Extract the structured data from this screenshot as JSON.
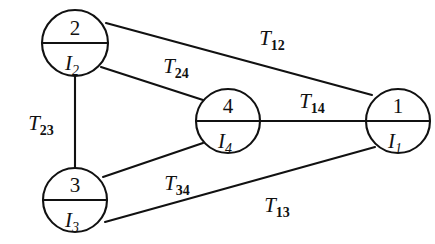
{
  "diagram": {
    "type": "thermal-network-graph",
    "canvas": {
      "width": 435,
      "height": 244,
      "background": "#ffffff"
    },
    "stroke_color": "#111111",
    "nodes": [
      {
        "id": "node-1",
        "top_label": "1",
        "bottom_label": "I",
        "bottom_sub": "1",
        "cx": 398,
        "cy": 121,
        "r": 32
      },
      {
        "id": "node-2",
        "top_label": "2",
        "bottom_label": "I",
        "bottom_sub": "2",
        "cx": 75,
        "cy": 43,
        "r": 33
      },
      {
        "id": "node-3",
        "top_label": "3",
        "bottom_label": "I",
        "bottom_sub": "3",
        "cx": 75,
        "cy": 200,
        "r": 32
      },
      {
        "id": "node-4",
        "top_label": "4",
        "bottom_label": "I",
        "bottom_sub": "4",
        "cx": 228,
        "cy": 121,
        "r": 32
      }
    ],
    "edges": [
      {
        "id": "edge-12",
        "from": "node-2",
        "to": "node-1",
        "label": "T",
        "sub": "12",
        "x1": 106,
        "y1": 23,
        "x2": 372,
        "y2": 95,
        "label_x": 272,
        "label_y": 45
      },
      {
        "id": "edge-24",
        "from": "node-2",
        "to": "node-4",
        "label": "T",
        "sub": "24",
        "x1": 101,
        "y1": 67,
        "x2": 203,
        "y2": 100,
        "label_x": 176,
        "label_y": 73
      },
      {
        "id": "edge-23",
        "from": "node-2",
        "to": "node-3",
        "label": "T",
        "sub": "23",
        "x1": 75,
        "y1": 76,
        "x2": 75,
        "y2": 168,
        "label_x": 41,
        "label_y": 130
      },
      {
        "id": "edge-14",
        "from": "node-4",
        "to": "node-1",
        "label": "T",
        "sub": "14",
        "x1": 260,
        "y1": 121,
        "x2": 366,
        "y2": 121,
        "label_x": 312,
        "label_y": 108
      },
      {
        "id": "edge-34",
        "from": "node-3",
        "to": "node-4",
        "label": "T",
        "sub": "34",
        "x1": 103,
        "y1": 177,
        "x2": 203,
        "y2": 143,
        "label_x": 177,
        "label_y": 190
      },
      {
        "id": "edge-13",
        "from": "node-3",
        "to": "node-1",
        "label": "T",
        "sub": "13",
        "x1": 105,
        "y1": 222,
        "x2": 375,
        "y2": 147,
        "label_x": 277,
        "label_y": 212
      }
    ]
  }
}
